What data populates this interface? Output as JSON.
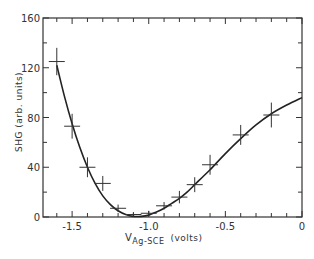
{
  "chart_data": {
    "type": "scatter",
    "title": "",
    "xlabel_main": "V",
    "xlabel_sub": "Ag-SCE",
    "xlabel_units": "(volts)",
    "ylabel": "SHG (arb. units)",
    "xlim": [
      -1.69,
      0
    ],
    "ylim": [
      0,
      160
    ],
    "x_ticks": [
      {
        "value": -1.5,
        "label": "-1.5"
      },
      {
        "value": -1.0,
        "label": "-1.0"
      },
      {
        "value": -0.5,
        "label": "-0.5"
      },
      {
        "value": 0,
        "label": "0"
      }
    ],
    "x_minor_step": 0.1,
    "y_ticks": [
      {
        "value": 0,
        "label": "0"
      },
      {
        "value": 40,
        "label": "40"
      },
      {
        "value": 80,
        "label": "80"
      },
      {
        "value": 120,
        "label": "120"
      },
      {
        "value": 160,
        "label": "160"
      }
    ],
    "y_minor_step": 20,
    "grid": false,
    "series": [
      {
        "name": "measured",
        "style": "crosses-with-error-bars",
        "points": [
          {
            "x": -1.6,
            "y": 125,
            "err": 11
          },
          {
            "x": -1.5,
            "y": 73,
            "err": 10
          },
          {
            "x": -1.4,
            "y": 40,
            "err": 8
          },
          {
            "x": -1.3,
            "y": 27,
            "err": 6
          },
          {
            "x": -1.2,
            "y": 7,
            "err": 3
          },
          {
            "x": -1.1,
            "y": 2,
            "err": 2
          },
          {
            "x": -1.0,
            "y": 3,
            "err": 2
          },
          {
            "x": -0.9,
            "y": 9,
            "err": 3
          },
          {
            "x": -0.8,
            "y": 16,
            "err": 5
          },
          {
            "x": -0.7,
            "y": 26,
            "err": 6
          },
          {
            "x": -0.6,
            "y": 42,
            "err": 8
          },
          {
            "x": -0.4,
            "y": 66,
            "err": 8
          },
          {
            "x": -0.2,
            "y": 82,
            "err": 10
          }
        ]
      },
      {
        "name": "fit",
        "style": "line",
        "points": [
          {
            "x": -1.6,
            "y": 122
          },
          {
            "x": -1.55,
            "y": 97
          },
          {
            "x": -1.5,
            "y": 75
          },
          {
            "x": -1.45,
            "y": 56
          },
          {
            "x": -1.4,
            "y": 40
          },
          {
            "x": -1.35,
            "y": 27
          },
          {
            "x": -1.3,
            "y": 17
          },
          {
            "x": -1.25,
            "y": 10
          },
          {
            "x": -1.2,
            "y": 5
          },
          {
            "x": -1.15,
            "y": 2
          },
          {
            "x": -1.1,
            "y": 0.5
          },
          {
            "x": -1.05,
            "y": 0.5
          },
          {
            "x": -1.0,
            "y": 1.5
          },
          {
            "x": -0.95,
            "y": 4
          },
          {
            "x": -0.9,
            "y": 7
          },
          {
            "x": -0.85,
            "y": 11
          },
          {
            "x": -0.8,
            "y": 15
          },
          {
            "x": -0.75,
            "y": 20
          },
          {
            "x": -0.7,
            "y": 26
          },
          {
            "x": -0.65,
            "y": 32
          },
          {
            "x": -0.6,
            "y": 38
          },
          {
            "x": -0.5,
            "y": 51
          },
          {
            "x": -0.4,
            "y": 63
          },
          {
            "x": -0.3,
            "y": 74
          },
          {
            "x": -0.2,
            "y": 83
          },
          {
            "x": -0.1,
            "y": 90
          },
          {
            "x": 0,
            "y": 96
          }
        ]
      }
    ]
  }
}
